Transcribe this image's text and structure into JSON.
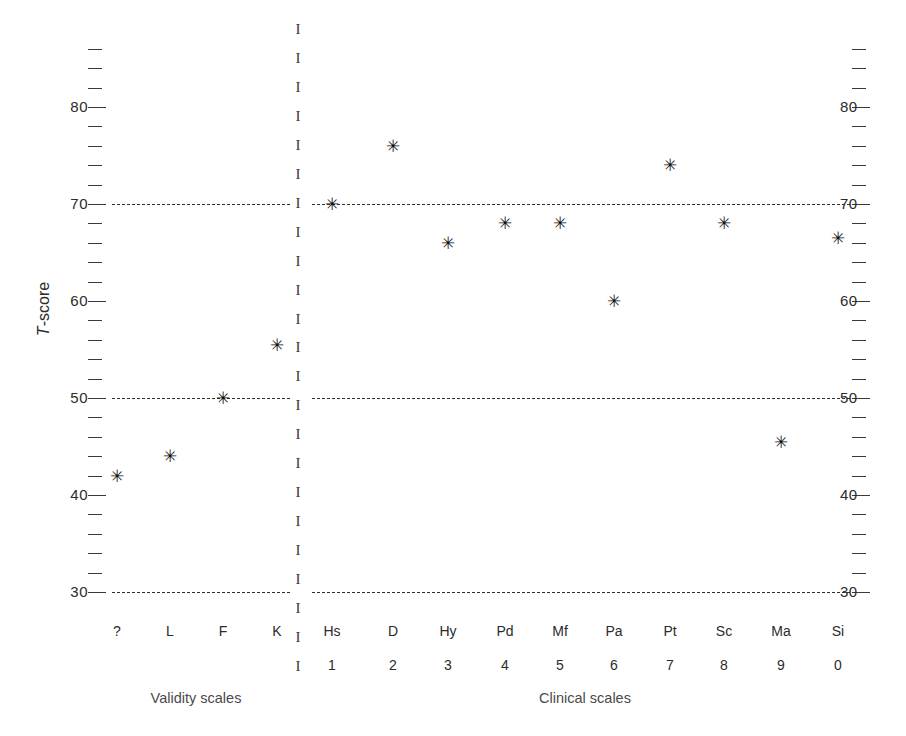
{
  "chart_data": {
    "type": "scatter",
    "title": "",
    "xlabel": "",
    "ylabel": "T-score",
    "ylim": [
      28,
      86
    ],
    "yticks_major": [
      30,
      40,
      50,
      60,
      70,
      80
    ],
    "ytick_minor_step": 2,
    "grid": false,
    "reference_lines": [
      30,
      50,
      70
    ],
    "reference_line_style": "dashed",
    "axis_label_sides": [
      "left",
      "right"
    ],
    "marker_glyph": "✳",
    "groups": [
      {
        "name": "Validity scales",
        "caption": "Validity scales",
        "categories": [
          "?",
          "L",
          "F",
          "K"
        ],
        "numbers": [
          "",
          "",
          "",
          ""
        ],
        "values": [
          42,
          44,
          50,
          55.5
        ]
      },
      {
        "name": "Clinical scales",
        "caption": "Clinical scales",
        "categories": [
          "Hs",
          "D",
          "Hy",
          "Pd",
          "Mf",
          "Pa",
          "Pt",
          "Sc",
          "Ma",
          "Si"
        ],
        "numbers": [
          "1",
          "2",
          "3",
          "4",
          "5",
          "6",
          "7",
          "8",
          "9",
          "0"
        ],
        "values": [
          70,
          76,
          66,
          68,
          68,
          60,
          74,
          68,
          45.5,
          66.5
        ]
      }
    ]
  },
  "axis": {
    "y_title_prefix": "T",
    "y_title_suffix": "-score",
    "tick_labels": [
      "80",
      "70",
      "60",
      "50",
      "40",
      "30"
    ],
    "right_tick_labels": [
      "80",
      "70",
      "60",
      "50",
      "40",
      "30"
    ]
  },
  "divider": {
    "glyph": "I",
    "count": 23
  },
  "colors": {
    "ink": "#231f20",
    "marker": "#111111",
    "refline": "#2f2f2f",
    "caption": "#4a4a4a",
    "background": "#ffffff"
  }
}
